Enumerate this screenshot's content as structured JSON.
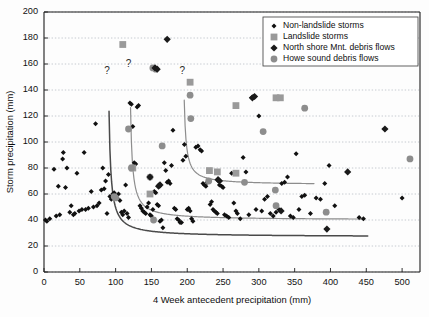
{
  "chart_data": {
    "type": "scatter",
    "title": "",
    "xlabel": "4 Week antecedent precipitation (mm)",
    "ylabel": "Storm precipitation (mm)",
    "xlim": [
      0,
      525
    ],
    "ylim": [
      0,
      200
    ],
    "xticks": [
      0,
      50,
      100,
      150,
      200,
      250,
      300,
      350,
      400,
      450,
      500
    ],
    "yticks": [
      0,
      20,
      40,
      60,
      80,
      100,
      120,
      140,
      160,
      180,
      200
    ],
    "xtick_labels": [
      "0",
      "50",
      "100",
      "150",
      "200",
      "250",
      "300",
      "350",
      "400",
      "450",
      "500"
    ],
    "ytick_labels": [
      "0",
      "20",
      "40",
      "60",
      "80",
      "100",
      "120",
      "140",
      "160",
      "180",
      "200"
    ],
    "grid": "horizontal-dotted",
    "legend_position": "top-right",
    "series": [
      {
        "name": "Non-landslide storms",
        "marker": "small-diamond",
        "color": "#111111",
        "points": [
          [
            2,
            40
          ],
          [
            4,
            39
          ],
          [
            8,
            41
          ],
          [
            14,
            79
          ],
          [
            17,
            43
          ],
          [
            20,
            66
          ],
          [
            22,
            44
          ],
          [
            26,
            87
          ],
          [
            27,
            92
          ],
          [
            30,
            65
          ],
          [
            32,
            80
          ],
          [
            36,
            46
          ],
          [
            38,
            51
          ],
          [
            41,
            44
          ],
          [
            43,
            45
          ],
          [
            46,
            76
          ],
          [
            49,
            47
          ],
          [
            53,
            48
          ],
          [
            56,
            92
          ],
          [
            58,
            48
          ],
          [
            62,
            49
          ],
          [
            66,
            62
          ],
          [
            69,
            50
          ],
          [
            72,
            114
          ],
          [
            74,
            51
          ],
          [
            77,
            53
          ],
          [
            80,
            63
          ],
          [
            82,
            80
          ],
          [
            84,
            64
          ],
          [
            86,
            70
          ],
          [
            88,
            45
          ],
          [
            90,
            75
          ],
          [
            92,
            58
          ],
          [
            94,
            56
          ],
          [
            96,
            60
          ],
          [
            98,
            61
          ],
          [
            100,
            59
          ],
          [
            102,
            57
          ],
          [
            104,
            60
          ],
          [
            106,
            55
          ],
          [
            108,
            46
          ],
          [
            110,
            44
          ],
          [
            112,
            47
          ],
          [
            114,
            67
          ],
          [
            116,
            45
          ],
          [
            118,
            42
          ],
          [
            120,
            130
          ],
          [
            122,
            129
          ],
          [
            124,
            112
          ],
          [
            126,
            84
          ],
          [
            128,
            83
          ],
          [
            130,
            127
          ],
          [
            132,
            128
          ],
          [
            134,
            51
          ],
          [
            136,
            49
          ],
          [
            138,
            47
          ],
          [
            140,
            46
          ],
          [
            142,
            45
          ],
          [
            144,
            50
          ],
          [
            146,
            53
          ],
          [
            148,
            44
          ],
          [
            150,
            43
          ],
          [
            152,
            48
          ],
          [
            154,
            62
          ],
          [
            156,
            61
          ],
          [
            158,
            52
          ],
          [
            160,
            51
          ],
          [
            162,
            39
          ],
          [
            164,
            40
          ],
          [
            166,
            34
          ],
          [
            168,
            84
          ],
          [
            170,
            78
          ],
          [
            172,
            69
          ],
          [
            174,
            70
          ],
          [
            176,
            68
          ],
          [
            178,
            82
          ],
          [
            180,
            109
          ],
          [
            182,
            49
          ],
          [
            184,
            48
          ],
          [
            186,
            41
          ],
          [
            188,
            40
          ],
          [
            190,
            38
          ],
          [
            192,
            38
          ],
          [
            194,
            86
          ],
          [
            196,
            98
          ],
          [
            198,
            89
          ],
          [
            200,
            48
          ],
          [
            202,
            49
          ],
          [
            204,
            47
          ],
          [
            206,
            41
          ],
          [
            208,
            39
          ],
          [
            212,
            96
          ],
          [
            215,
            97
          ],
          [
            218,
            94
          ],
          [
            220,
            93
          ],
          [
            222,
            68
          ],
          [
            224,
            67
          ],
          [
            226,
            66
          ],
          [
            228,
            69
          ],
          [
            230,
            70
          ],
          [
            232,
            52
          ],
          [
            234,
            54
          ],
          [
            236,
            48
          ],
          [
            238,
            47
          ],
          [
            240,
            46
          ],
          [
            242,
            45
          ],
          [
            245,
            67
          ],
          [
            248,
            66
          ],
          [
            250,
            65
          ],
          [
            252,
            44
          ],
          [
            255,
            43
          ],
          [
            258,
            42
          ],
          [
            262,
            76
          ],
          [
            265,
            53
          ],
          [
            268,
            47
          ],
          [
            270,
            45
          ],
          [
            274,
            41
          ],
          [
            278,
            88
          ],
          [
            282,
            77
          ],
          [
            286,
            44
          ],
          [
            290,
            134
          ],
          [
            293,
            135
          ],
          [
            296,
            48
          ],
          [
            300,
            120
          ],
          [
            304,
            47
          ],
          [
            308,
            56
          ],
          [
            312,
            58
          ],
          [
            316,
            45
          ],
          [
            320,
            43
          ],
          [
            324,
            46
          ],
          [
            328,
            48
          ],
          [
            332,
            68
          ],
          [
            336,
            69
          ],
          [
            340,
            73
          ],
          [
            344,
            43
          ],
          [
            348,
            42
          ],
          [
            352,
            91
          ],
          [
            356,
            48
          ],
          [
            360,
            58
          ],
          [
            364,
            59
          ],
          [
            372,
            45
          ],
          [
            380,
            57
          ],
          [
            386,
            56
          ],
          [
            392,
            68
          ],
          [
            398,
            82
          ],
          [
            406,
            51
          ],
          [
            424,
            77
          ],
          [
            440,
            42
          ],
          [
            446,
            41
          ],
          [
            476,
            110
          ],
          [
            500,
            57
          ]
        ]
      },
      {
        "name": "Landslide storms",
        "marker": "square",
        "color": "#9a9a9a",
        "points": [
          [
            110,
            175
          ],
          [
            124,
            80
          ],
          [
            148,
            60
          ],
          [
            204,
            146
          ],
          [
            231,
            78
          ],
          [
            242,
            77
          ],
          [
            268,
            128
          ],
          [
            268,
            76
          ],
          [
            324,
            134
          ],
          [
            330,
            134
          ]
        ]
      },
      {
        "name": "North shore Mnt. debris flows",
        "marker": "large-diamond",
        "color": "#1a1a1a",
        "points": [
          [
            172,
            179
          ],
          [
            155,
            157
          ],
          [
            158,
            156
          ],
          [
            291,
            134
          ],
          [
            294,
            135
          ],
          [
            243,
            71
          ],
          [
            160,
            66
          ],
          [
            162,
            67
          ],
          [
            245,
            70
          ],
          [
            331,
            47
          ],
          [
            395,
            33
          ],
          [
            476,
            110
          ],
          [
            424,
            77
          ],
          [
            148,
            73
          ]
        ]
      },
      {
        "name": "Howe sound debris flows",
        "marker": "circle",
        "color": "#8d8d8d",
        "points": [
          [
            118,
            110
          ],
          [
            122,
            80
          ],
          [
            152,
            157
          ],
          [
            156,
            156
          ],
          [
            165,
            97
          ],
          [
            204,
            136
          ],
          [
            205,
            118
          ],
          [
            306,
            108
          ],
          [
            364,
            126
          ],
          [
            98,
            58
          ],
          [
            100,
            57
          ],
          [
            153,
            40
          ],
          [
            230,
            70
          ],
          [
            280,
            69
          ],
          [
            323,
            63
          ],
          [
            324,
            51
          ],
          [
            394,
            46
          ],
          [
            511,
            87
          ],
          [
            148,
            73
          ]
        ]
      }
    ],
    "threshold_curves": [
      {
        "name": "lower-threshold",
        "color": "#4a4a4a",
        "asymptote_x": 88,
        "tail_y": 27,
        "x_end": 452,
        "label": "?"
      },
      {
        "name": "middle-threshold",
        "color": "#8d8d8d",
        "asymptote_x": 118,
        "tail_y": 40,
        "x_end": 448,
        "label": "?"
      },
      {
        "name": "upper-threshold",
        "color": "#8d8d8d",
        "asymptote_x": 193,
        "tail_y": 67,
        "x_end": 378,
        "label": "?"
      }
    ],
    "annotations": [
      {
        "text": "?",
        "x": 88,
        "y": 152
      },
      {
        "text": "?",
        "x": 118,
        "y": 158
      },
      {
        "text": "?",
        "x": 193,
        "y": 152
      }
    ]
  },
  "legend": {
    "items": [
      {
        "label": "Non-landslide storms",
        "marker": "small-diamond",
        "color": "#111111"
      },
      {
        "label": "Landslide storms",
        "marker": "square",
        "color": "#9a9a9a"
      },
      {
        "label": "North shore Mnt. debris flows",
        "marker": "large-diamond",
        "color": "#1a1a1a"
      },
      {
        "label": "Howe sound debris flows",
        "marker": "circle",
        "color": "#8d8d8d"
      }
    ]
  },
  "colors": {
    "axis": "#1c1c1c",
    "grid": "#9aa3ae",
    "background": "#fdfdfd",
    "dark_curve": "#4a4a4a",
    "gray_curve": "#8d8d8d"
  }
}
